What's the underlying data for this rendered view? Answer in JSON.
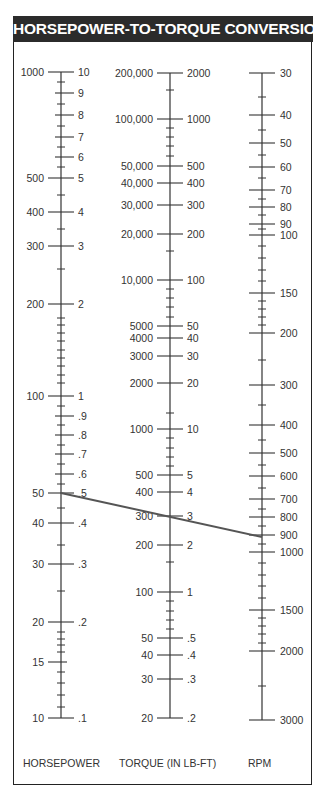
{
  "title": "HORSEPOWER-TO-TORQUE CONVERSION",
  "axes": {
    "horsepower": {
      "title": "HORSEPOWER",
      "x": 61,
      "major": [
        {
          "y": 72,
          "left": "1000",
          "right": "10"
        },
        {
          "y": 93,
          "left": "",
          "right": "9"
        },
        {
          "y": 115,
          "left": "",
          "right": "8"
        },
        {
          "y": 137,
          "left": "",
          "right": "7"
        },
        {
          "y": 157,
          "left": "",
          "right": "6"
        },
        {
          "y": 178,
          "left": "500",
          "right": "5"
        },
        {
          "y": 212,
          "left": "400",
          "right": "4"
        },
        {
          "y": 246,
          "left": "300",
          "right": "3"
        },
        {
          "y": 304,
          "left": "200",
          "right": "2"
        },
        {
          "y": 396,
          "left": "100",
          "right": "1"
        },
        {
          "y": 416,
          "left": "",
          "right": ".9"
        },
        {
          "y": 435,
          "left": "",
          "right": ".8"
        },
        {
          "y": 454,
          "left": "",
          "right": ".7"
        },
        {
          "y": 474,
          "left": "",
          "right": ".6"
        },
        {
          "y": 493,
          "left": "50",
          "right": ".5"
        },
        {
          "y": 523,
          "left": "40",
          "right": ".4"
        },
        {
          "y": 564,
          "left": "30",
          "right": ".3"
        },
        {
          "y": 622,
          "left": "20",
          "right": ".2"
        },
        {
          "y": 662,
          "left": "15",
          "right": ""
        },
        {
          "y": 718,
          "left": "10",
          "right": ".1"
        }
      ],
      "minor": [
        82,
        104,
        126,
        147,
        167,
        195,
        229,
        269,
        318,
        325,
        333,
        341,
        350,
        358,
        366,
        375,
        383,
        406,
        425,
        445,
        464,
        484,
        508,
        545,
        591,
        632,
        639,
        645,
        652,
        672,
        683,
        695,
        707
      ]
    },
    "torque": {
      "title": "TORQUE (IN LB-FT)",
      "x": 170,
      "major": [
        {
          "y": 73,
          "left": "200,000",
          "right": "2000"
        },
        {
          "y": 119,
          "left": "100,000",
          "right": "1000"
        },
        {
          "y": 166,
          "left": "50,000",
          "right": "500"
        },
        {
          "y": 183,
          "left": "40,000",
          "right": "400"
        },
        {
          "y": 205,
          "left": "30,000",
          "right": "300"
        },
        {
          "y": 234,
          "left": "20,000",
          "right": "200"
        },
        {
          "y": 280,
          "left": "10,000",
          "right": "100"
        },
        {
          "y": 326,
          "left": "5000",
          "right": "50"
        },
        {
          "y": 338,
          "left": "4000",
          "right": "40"
        },
        {
          "y": 356,
          "left": "3000",
          "right": "30"
        },
        {
          "y": 383,
          "left": "2000",
          "right": "20"
        },
        {
          "y": 429,
          "left": "1000",
          "right": "10"
        },
        {
          "y": 475,
          "left": "500",
          "right": "5"
        },
        {
          "y": 492,
          "left": "400",
          "right": "4"
        },
        {
          "y": 516,
          "left": "300",
          "right": "3"
        },
        {
          "y": 545,
          "left": "200",
          "right": "2"
        },
        {
          "y": 592,
          "left": "100",
          "right": "1"
        },
        {
          "y": 638,
          "left": "50",
          "right": ".5"
        },
        {
          "y": 655,
          "left": "40",
          "right": ".4"
        },
        {
          "y": 679,
          "left": "30",
          "right": ".3"
        },
        {
          "y": 718,
          "left": "20",
          "right": ".2"
        }
      ],
      "minor": [
        90,
        128,
        137,
        146,
        156,
        251,
        289,
        298,
        307,
        317,
        413,
        438,
        448,
        457,
        466,
        562,
        601,
        611,
        620,
        629
      ]
    },
    "rpm": {
      "title": "RPM",
      "x": 262,
      "major": [
        {
          "y": 73,
          "label": "30"
        },
        {
          "y": 115,
          "label": "40"
        },
        {
          "y": 143,
          "label": "50"
        },
        {
          "y": 167,
          "label": "60"
        },
        {
          "y": 190,
          "label": "70"
        },
        {
          "y": 207,
          "label": "80"
        },
        {
          "y": 224,
          "label": "90"
        },
        {
          "y": 235,
          "label": "100"
        },
        {
          "y": 293,
          "label": "150"
        },
        {
          "y": 333,
          "label": "200"
        },
        {
          "y": 385,
          "label": "300"
        },
        {
          "y": 425,
          "label": "400"
        },
        {
          "y": 453,
          "label": "500"
        },
        {
          "y": 476,
          "label": "600"
        },
        {
          "y": 499,
          "label": "700"
        },
        {
          "y": 517,
          "label": "800"
        },
        {
          "y": 535,
          "label": "900"
        },
        {
          "y": 552,
          "label": "1000"
        },
        {
          "y": 610,
          "label": "1500"
        },
        {
          "y": 651,
          "label": "2000"
        },
        {
          "y": 720,
          "label": "3000"
        }
      ],
      "minor": [
        97,
        130,
        155,
        178,
        199,
        215,
        229,
        246,
        258,
        270,
        281,
        301,
        309,
        317,
        325,
        360,
        405,
        440,
        465,
        488,
        509,
        526,
        544,
        563,
        575,
        586,
        598,
        618,
        626,
        634,
        643,
        686
      ]
    }
  },
  "example_line": {
    "x1": 61,
    "y1": 493,
    "x2": 262,
    "y2": 537,
    "color": "#555555"
  },
  "chart_data": {
    "type": "nomogram",
    "title": "HORSEPOWER-TO-TORQUE CONVERSION",
    "scales": [
      {
        "name": "HORSEPOWER",
        "scale": "log",
        "left_ticks": [
          "1000",
          "500",
          "400",
          "300",
          "200",
          "100",
          "50",
          "40",
          "30",
          "20",
          "15",
          "10"
        ],
        "right_ticks": [
          "10",
          "9",
          "8",
          "7",
          "6",
          "5",
          "4",
          "3",
          "2",
          "1",
          ".9",
          ".8",
          ".7",
          ".6",
          ".5",
          ".4",
          ".3",
          ".2",
          ".1"
        ],
        "range_left": [
          10,
          1000
        ],
        "range_right": [
          0.1,
          10
        ]
      },
      {
        "name": "TORQUE (IN LB-FT)",
        "scale": "log",
        "left_ticks": [
          "200,000",
          "100,000",
          "50,000",
          "40,000",
          "30,000",
          "20,000",
          "10,000",
          "5000",
          "4000",
          "3000",
          "2000",
          "1000",
          "500",
          "400",
          "300",
          "200",
          "100",
          "50",
          "40",
          "30",
          "20"
        ],
        "right_ticks": [
          "2000",
          "1000",
          "500",
          "400",
          "300",
          "200",
          "100",
          "50",
          "40",
          "30",
          "20",
          "10",
          "5",
          "4",
          "3",
          "2",
          "1",
          ".5",
          ".4",
          ".3",
          ".2"
        ],
        "range_left": [
          20,
          200000
        ],
        "range_right": [
          0.2,
          2000
        ]
      },
      {
        "name": "RPM",
        "scale": "log",
        "ticks": [
          "30",
          "40",
          "50",
          "60",
          "70",
          "80",
          "90",
          "100",
          "150",
          "200",
          "300",
          "400",
          "500",
          "600",
          "700",
          "800",
          "900",
          "1000",
          "1500",
          "2000",
          "3000"
        ],
        "range": [
          30,
          3000
        ]
      }
    ],
    "example": {
      "horsepower": 50,
      "torque_lb_ft": 300,
      "rpm": 900
    }
  }
}
